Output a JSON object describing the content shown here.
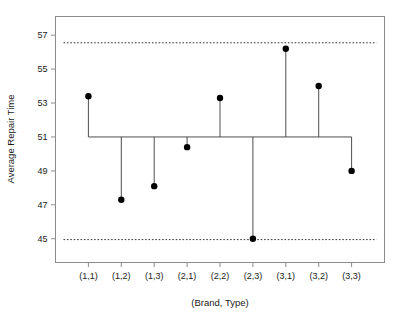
{
  "chart_data": {
    "type": "scatter",
    "title": "",
    "subtitle": "",
    "xlabel": "(Brand, Type)",
    "ylabel": "Average Repair Time",
    "categories": [
      "(1,1)",
      "(1,2)",
      "(1,3)",
      "(2,1)",
      "(2,2)",
      "(2,3)",
      "(3,1)",
      "(3,2)",
      "(3,3)"
    ],
    "values": [
      53.4,
      47.3,
      48.1,
      50.4,
      53.3,
      45.0,
      56.2,
      54.0,
      49.0
    ],
    "series": [
      {
        "name": "Average Repair Time",
        "values": [
          53.4,
          47.3,
          48.1,
          50.4,
          53.3,
          45.0,
          56.2,
          54.0,
          49.0
        ]
      }
    ],
    "center_line": 51.0,
    "upper_limit": 56.55,
    "lower_limit": 44.95,
    "ylim": [
      43.6,
      58.1
    ],
    "ytick_labels": [
      "45",
      "47",
      "49",
      "51",
      "53",
      "55",
      "57"
    ],
    "ytick_values": [
      45,
      47,
      49,
      51,
      53,
      55,
      57
    ],
    "grid": false,
    "legend": "none",
    "marker": "filled-circle",
    "marker_color": "#000000",
    "line_color": "#4d4d4d",
    "limit_line_style": "dotted",
    "frame_color": "#8c8c8c"
  },
  "axes": {
    "x_title": "(Brand, Type)",
    "y_title": "Average Repair Time"
  }
}
